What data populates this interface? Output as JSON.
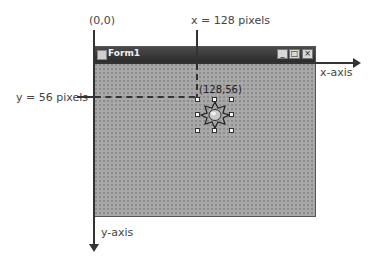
{
  "labels": {
    "origin": "(0,0)",
    "x_coord": "x = 128 pixels",
    "y_coord": "y = 56 pixels",
    "point": "(128,56)",
    "x_axis": "x-axis",
    "y_axis": "y-axis"
  },
  "form": {
    "title": "Form1",
    "controls": {
      "minimize": "_",
      "maximize": "□",
      "close": "×"
    }
  },
  "control": {
    "icon": "star-gear-icon",
    "x": 128,
    "y": 56
  },
  "colors": {
    "titlebar": "#2c2c2c",
    "client": "#a8a8a8",
    "axis": "#333333"
  }
}
